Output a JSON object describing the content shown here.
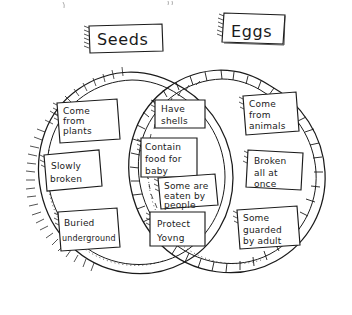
{
  "diagram": {
    "type": "venn",
    "kind": "hand-drawn-venn-diagram",
    "title_left": "Seeds",
    "title_right": "Eggs",
    "left_circle": {
      "label": "Seeds",
      "border_style": "hatched",
      "items": [
        "Come from plants",
        "Slowly broken",
        "Buried underground"
      ]
    },
    "right_circle": {
      "label": "Eggs",
      "border_style": "segmented",
      "items": [
        "Come from animals",
        "Broken all at once",
        "Some guarded by adult"
      ]
    },
    "overlap": {
      "items": [
        "Have shells",
        "Contain food for baby",
        "Some are eaten by people",
        "Protect young"
      ]
    }
  },
  "notes": {
    "left_box_1_lines": [
      "Come",
      "from",
      "plants"
    ],
    "left_box_2_lines": [
      "Slowly",
      "broken"
    ],
    "left_box_3_lines": [
      "Buried",
      "underground"
    ],
    "mid_box_1_lines": [
      "Have",
      "shells"
    ],
    "mid_box_2_lines": [
      "Contain",
      "food for",
      "baby"
    ],
    "mid_box_3_lines": [
      "Some are",
      "eaten by",
      "people"
    ],
    "mid_box_4_lines": [
      "Protect",
      "Yovng"
    ],
    "right_box_1_lines": [
      "Come",
      "from",
      "animals"
    ],
    "right_box_2_lines": [
      "Broken",
      "all at",
      "once"
    ],
    "right_box_3_lines": [
      "Some",
      "guarded",
      "by adult"
    ]
  },
  "colors": {
    "ink": "#1b1b1b",
    "paper": "#ffffff",
    "faint": "#9a9a9a"
  }
}
